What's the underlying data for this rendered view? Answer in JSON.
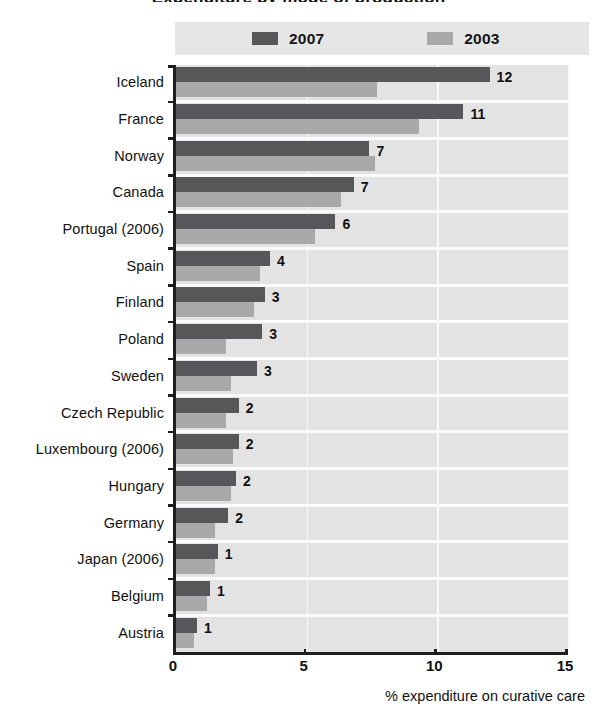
{
  "chart_data": {
    "type": "bar",
    "orientation": "horizontal",
    "title": "Expenditure by mode of production",
    "xlabel": "% expenditure on curative care",
    "ylabel": "",
    "xlim": [
      0,
      15
    ],
    "xticks": [
      0,
      5,
      10,
      15
    ],
    "grid": "vertical-white",
    "legend_position": "top",
    "categories": [
      "Iceland",
      "France",
      "Norway",
      "Canada",
      "Portugal (2006)",
      "Spain",
      "Finland",
      "Poland",
      "Sweden",
      "Czech Republic",
      "Luxembourg (2006)",
      "Hungary",
      "Germany",
      "Japan (2006)",
      "Belgium",
      "Austria"
    ],
    "series": [
      {
        "name": "2007",
        "color": "#575759",
        "values": [
          12.0,
          11.0,
          7.4,
          6.8,
          6.1,
          3.6,
          3.4,
          3.3,
          3.1,
          2.4,
          2.4,
          2.3,
          2.0,
          1.6,
          1.3,
          0.8
        ],
        "data_labels": [
          "12",
          "11",
          "7",
          "7",
          "6",
          "4",
          "3",
          "3",
          "3",
          "2",
          "2",
          "2",
          "2",
          "1",
          "1",
          "1"
        ]
      },
      {
        "name": "2003",
        "color": "#a9a9a9",
        "values": [
          7.7,
          9.3,
          7.6,
          6.3,
          5.3,
          3.2,
          3.0,
          1.9,
          2.1,
          1.9,
          2.2,
          2.1,
          1.5,
          1.5,
          1.2,
          0.7
        ],
        "data_labels": []
      }
    ]
  },
  "legend": {
    "entries": [
      {
        "label": "2007",
        "color": "#575759"
      },
      {
        "label": "2003",
        "color": "#a9a9a9"
      }
    ]
  },
  "axis": {
    "x_tick_labels": [
      "0",
      "5",
      "10",
      "15"
    ],
    "x_axis_title": "% expenditure on curative care"
  },
  "colors": {
    "series_2007": "#575759",
    "series_2003": "#a9a9a9",
    "plot_background": "#e3e3e3",
    "gridline": "#fafafa",
    "axis_line": "#1e1e1e",
    "legend_background": "#e6e6e6"
  }
}
